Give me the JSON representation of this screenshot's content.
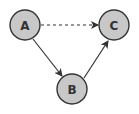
{
  "diagram": {
    "type": "directed-graph",
    "nodes": [
      {
        "id": "A",
        "label": "A",
        "cx": 25,
        "cy": 25
      },
      {
        "id": "B",
        "label": "B",
        "cx": 72,
        "cy": 89
      },
      {
        "id": "C",
        "label": "C",
        "cx": 114,
        "cy": 25
      }
    ],
    "edges": [
      {
        "from": "A",
        "to": "C",
        "style": "dashed"
      },
      {
        "from": "A",
        "to": "B",
        "style": "solid"
      },
      {
        "from": "B",
        "to": "C",
        "style": "solid"
      }
    ],
    "colors": {
      "node_fill": "#c8c8c8",
      "node_stroke": "#333333",
      "edge": "#333333",
      "label": "#333333"
    }
  }
}
